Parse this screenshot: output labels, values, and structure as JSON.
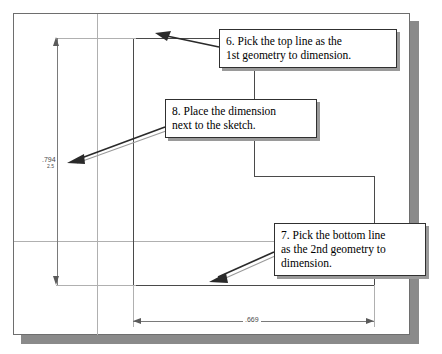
{
  "document": {
    "type": "cad-sketch-instruction-figure",
    "background": "#ffffff",
    "frame_border_color": "#6e6e6e",
    "shadow_color": "#8a8a8a"
  },
  "dimensions": [
    {
      "name": "vertical-dimension",
      "value": ".794",
      "sub_value": "2.5",
      "orientation": "vertical",
      "position": "left"
    },
    {
      "name": "horizontal-dimension",
      "value": ".669",
      "orientation": "horizontal",
      "position": "bottom"
    }
  ],
  "callouts": [
    {
      "id": "callout-6",
      "step": "6",
      "line1": "6. Pick the top line as the",
      "line2": "1st geometry to dimension.",
      "text": "6. Pick the top line as the 1st geometry to dimension.",
      "points_to": "top-line-of-sketch"
    },
    {
      "id": "callout-8",
      "step": "8",
      "line1": "8. Place the dimension",
      "line2": "next to the sketch.",
      "text": "8. Place the dimension next to the sketch.",
      "points_to": "vertical-dimension-placement"
    },
    {
      "id": "callout-7",
      "step": "7",
      "line1": "7. Pick the bottom line",
      "line2": "as the 2nd geometry to",
      "line3": "dimension.",
      "text": "7. Pick the bottom line as the 2nd geometry to dimension.",
      "points_to": "bottom-line-of-sketch"
    }
  ],
  "colors": {
    "line": "#7a7a7a",
    "line_light": "#b0b0b0",
    "line_dark": "#4a4a4a",
    "arrow": "#2a2a2a",
    "callout_border": "#303030",
    "callout_shadow": "#9a9a9a"
  }
}
